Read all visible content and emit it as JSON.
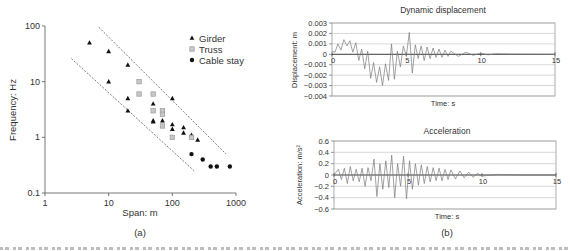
{
  "chart_data": [
    {
      "id": "a",
      "type": "scatter",
      "panel_label": "(a)",
      "title": "",
      "xlabel": "Span: m",
      "ylabel": "Frequency: Hz",
      "xscale": "log",
      "yscale": "log",
      "xlim": [
        1,
        1000
      ],
      "ylim": [
        0.1,
        100
      ],
      "xticks": [
        "1",
        "10",
        "100",
        "1000"
      ],
      "yticks": [
        "0.1",
        "1",
        "10",
        "100"
      ],
      "grid": false,
      "legend_position": "upper right",
      "series": [
        {
          "name": "Girder",
          "marker": "triangle",
          "color": "#111111",
          "points": [
            [
              5,
              50
            ],
            [
              10,
              35
            ],
            [
              10,
              10
            ],
            [
              20,
              20
            ],
            [
              20,
              5
            ],
            [
              20,
              3
            ],
            [
              50,
              4
            ],
            [
              50,
              2
            ],
            [
              50,
              1.9
            ],
            [
              70,
              2
            ],
            [
              100,
              5
            ],
            [
              100,
              1.7
            ],
            [
              100,
              1.4
            ],
            [
              150,
              1.5
            ],
            [
              150,
              1.2
            ],
            [
              200,
              1.1
            ],
            [
              250,
              0.9
            ]
          ]
        },
        {
          "name": "Truss",
          "marker": "square",
          "color": "#9a9a9a",
          "points": [
            [
              30,
              10
            ],
            [
              30,
              6
            ],
            [
              50,
              6
            ],
            [
              50,
              3
            ],
            [
              70,
              3
            ],
            [
              70,
              2.6
            ],
            [
              70,
              1.6
            ],
            [
              100,
              1
            ],
            [
              200,
              1
            ]
          ]
        },
        {
          "name": "Cable stay",
          "marker": "circle",
          "color": "#111111",
          "points": [
            [
              200,
              0.5
            ],
            [
              300,
              0.4
            ],
            [
              400,
              0.3
            ],
            [
              500,
              0.3
            ],
            [
              800,
              0.3
            ]
          ]
        }
      ],
      "bounds": {
        "style": "dashed",
        "upper": [
          [
            7,
            95
          ],
          [
            700,
            0.5
          ]
        ],
        "lower": [
          [
            2.6,
            26
          ],
          [
            220,
            0.25
          ]
        ]
      }
    },
    {
      "id": "b1",
      "type": "line",
      "panel_label": "",
      "title": "Dynamic displacement",
      "xlabel": "Time: s",
      "ylabel": "Displacement: m",
      "xlim": [
        0,
        15
      ],
      "ylim": [
        -0.004,
        0.003
      ],
      "xticks": [
        "0",
        "5",
        "10",
        "15"
      ],
      "yticks": [
        "0.003",
        "0.002",
        "0.001",
        "0",
        "-0.001",
        "-0.002",
        "-0.003",
        "-0.004"
      ],
      "grid": true,
      "series": [
        {
          "name": "Dynamic displacement",
          "color": "#777777",
          "x": [
            0,
            0.2,
            0.4,
            0.6,
            0.8,
            1.0,
            1.2,
            1.4,
            1.6,
            1.8,
            2.0,
            2.2,
            2.4,
            2.6,
            2.8,
            3.0,
            3.2,
            3.4,
            3.6,
            3.8,
            4.0,
            4.2,
            4.4,
            4.6,
            4.8,
            5.0,
            5.2,
            5.4,
            5.6,
            5.8,
            6.0,
            6.2,
            6.4,
            6.6,
            6.8,
            7.0,
            7.2,
            7.4,
            7.6,
            7.8,
            8.0,
            8.5,
            9.0,
            9.5,
            10.0,
            10.5,
            11.0,
            12.0,
            13.0,
            14.0,
            15.0
          ],
          "y": [
            0.0003,
            0.0002,
            0.001,
            0.0004,
            0.0014,
            0.0008,
            0.0013,
            0.0002,
            0.0011,
            -0.0006,
            0.0005,
            -0.0014,
            0.0003,
            -0.0023,
            -0.0008,
            -0.0027,
            -0.0012,
            -0.003,
            -0.0009,
            -0.0025,
            0.001,
            -0.0024,
            0.0003,
            -0.0012,
            0.0008,
            -0.0002,
            0.0021,
            -0.0018,
            0.0009,
            -0.0004,
            0.0008,
            -0.0006,
            0.0007,
            -0.0004,
            0.0006,
            -0.0003,
            0.0005,
            -0.0003,
            0.0004,
            -0.0002,
            0.0003,
            -0.0002,
            0.0002,
            -0.0001,
            0.0001,
            -5e-05,
            5e-05,
            2e-05,
            1e-05,
            0,
            0
          ]
        }
      ]
    },
    {
      "id": "b2",
      "type": "line",
      "panel_label": "(b)",
      "title": "Acceleration",
      "xlabel": "Time: s",
      "ylabel": "Acceleration: m/s²",
      "xlim": [
        0,
        15
      ],
      "ylim": [
        -0.6,
        0.6
      ],
      "xticks": [
        "0",
        "5",
        "10",
        "15"
      ],
      "yticks": [
        "0.6",
        "0.4",
        "0.2",
        "0",
        "-0.2",
        "-0.4",
        "-0.6"
      ],
      "grid": true,
      "series": [
        {
          "name": "Acceleration",
          "color": "#777777",
          "x": [
            0,
            0.3,
            0.5,
            0.7,
            0.9,
            1.1,
            1.3,
            1.5,
            1.7,
            1.9,
            2.1,
            2.3,
            2.5,
            2.7,
            2.9,
            3.1,
            3.3,
            3.5,
            3.7,
            3.9,
            4.1,
            4.3,
            4.5,
            4.7,
            4.9,
            5.1,
            5.3,
            5.5,
            5.7,
            5.9,
            6.1,
            6.3,
            6.5,
            6.7,
            6.9,
            7.1,
            7.3,
            7.5,
            7.7,
            7.9,
            8.2,
            8.5,
            8.8,
            9.1,
            9.4,
            9.7,
            10.0,
            11.0,
            12.0,
            13.0,
            15.0
          ],
          "y": [
            0,
            0.1,
            -0.08,
            0.12,
            -0.15,
            0.15,
            -0.1,
            0.1,
            -0.12,
            0.12,
            -0.2,
            0.13,
            -0.1,
            0.28,
            -0.38,
            0.2,
            -0.25,
            0.25,
            -0.22,
            0.35,
            -0.4,
            0.2,
            -0.2,
            0.33,
            -0.42,
            0.25,
            -0.25,
            0.2,
            -0.18,
            0.18,
            -0.15,
            0.15,
            -0.12,
            0.13,
            -0.1,
            0.12,
            -0.1,
            0.1,
            -0.08,
            0.09,
            -0.07,
            0.07,
            -0.05,
            0.05,
            -0.04,
            0.03,
            -0.02,
            0.01,
            0.005,
            0,
            0
          ]
        }
      ]
    }
  ],
  "panels": {
    "a": {
      "label": "(a)",
      "xlabel": "Span: m",
      "ylabel": "Frequency: Hz",
      "legend": [
        "Girder",
        "Truss",
        "Cable stay"
      ]
    },
    "b": {
      "label": "(b)",
      "top_title": "Dynamic displacement",
      "top_ylabel": "Displacement: m",
      "top_xlabel": "Time: s",
      "bottom_title": "Acceleration",
      "bottom_ylabel": "Acceleration: m/s²",
      "bottom_xlabel": "Time: s"
    }
  }
}
